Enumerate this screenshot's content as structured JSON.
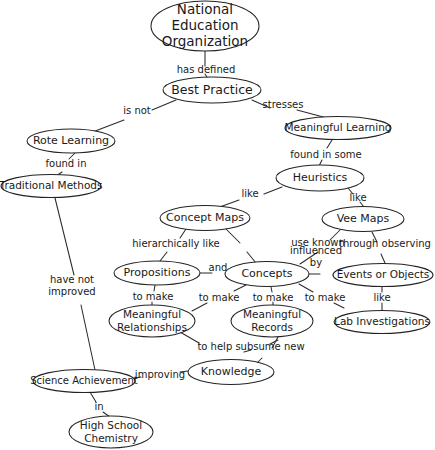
{
  "diagram": {
    "background_color": "#ffffff",
    "line_color": "#2b2b2b",
    "text_color": "#1a1a1a",
    "width": 435,
    "height": 450
  },
  "nodes": [
    {
      "id": "national-education-organization",
      "lines": [
        "National",
        "Education",
        "Organization"
      ],
      "cx": 205,
      "cy": 26,
      "rx": 54,
      "ry": 25,
      "font_size": 13.5
    },
    {
      "id": "best-practice",
      "lines": [
        "Best Practice"
      ],
      "cx": 212,
      "cy": 90,
      "rx": 49,
      "ry": 13,
      "font_size": 12.5
    },
    {
      "id": "rote-learning",
      "lines": [
        "Rote Learning"
      ],
      "cx": 71,
      "cy": 141,
      "rx": 44,
      "ry": 12,
      "font_size": 11
    },
    {
      "id": "meaningful-learning",
      "lines": [
        "Meaningful Learning"
      ],
      "cx": 338,
      "cy": 128,
      "rx": 53,
      "ry": 11.5,
      "font_size": 10.5
    },
    {
      "id": "traditional-methods",
      "lines": [
        "Traditional Methods"
      ],
      "cx": 51,
      "cy": 186,
      "rx": 50,
      "ry": 11.5,
      "font_size": 10.5
    },
    {
      "id": "heuristics",
      "lines": [
        "Heuristics"
      ],
      "cx": 320,
      "cy": 178,
      "rx": 44,
      "ry": 13,
      "font_size": 11
    },
    {
      "id": "concept-maps",
      "lines": [
        "Concept Maps"
      ],
      "cx": 205,
      "cy": 218,
      "rx": 45,
      "ry": 12.5,
      "font_size": 11
    },
    {
      "id": "vee-maps",
      "lines": [
        "Vee Maps"
      ],
      "cx": 363,
      "cy": 219,
      "rx": 41,
      "ry": 12.5,
      "font_size": 11
    },
    {
      "id": "propositions",
      "lines": [
        "Propositions"
      ],
      "cx": 157,
      "cy": 273,
      "rx": 43,
      "ry": 12,
      "font_size": 11
    },
    {
      "id": "concepts",
      "lines": [
        "Concepts"
      ],
      "cx": 267,
      "cy": 274,
      "rx": 42,
      "ry": 12.5,
      "font_size": 11
    },
    {
      "id": "events-or-objects",
      "lines": [
        "Events or Objects"
      ],
      "cx": 383,
      "cy": 275,
      "rx": 50,
      "ry": 11.5,
      "font_size": 10.5
    },
    {
      "id": "meaningful-relationships",
      "lines": [
        "Meaningful",
        "Relationships"
      ],
      "cx": 152,
      "cy": 321,
      "rx": 43,
      "ry": 16,
      "font_size": 10.5
    },
    {
      "id": "meaningful-records",
      "lines": [
        "Meaningful",
        "Records"
      ],
      "cx": 272,
      "cy": 321,
      "rx": 41,
      "ry": 16,
      "font_size": 10.5
    },
    {
      "id": "lab-investigations",
      "lines": [
        "Lab Investigations"
      ],
      "cx": 382,
      "cy": 322,
      "rx": 48,
      "ry": 11.5,
      "font_size": 10.5
    },
    {
      "id": "knowledge",
      "lines": [
        "Knowledge"
      ],
      "cx": 231,
      "cy": 372,
      "rx": 43,
      "ry": 12.5,
      "font_size": 11
    },
    {
      "id": "science-achievement",
      "lines": [
        "Science Achievement"
      ],
      "cx": 84,
      "cy": 381,
      "rx": 51,
      "ry": 11.5,
      "font_size": 10
    },
    {
      "id": "high-school-chemistry",
      "lines": [
        "High School",
        "Chemistry"
      ],
      "cx": 111,
      "cy": 432,
      "rx": 42,
      "ry": 16,
      "font_size": 10.5
    }
  ],
  "edges": [
    {
      "id": "neo-to-best-practice",
      "from": "national-education-organization",
      "to": "best-practice",
      "path": "M 205,51 L 205,66 M 205,74 L 207,77",
      "label": "has defined",
      "lx": 206,
      "ly": 70,
      "font_size": 10
    },
    {
      "id": "best-practice-to-rote-learning",
      "from": "best-practice",
      "to": "rote-learning",
      "path": "M 176,100 L 152,110 M 124,120 L 90,133",
      "label": "is not",
      "lx": 137,
      "ly": 111,
      "font_size": 10
    },
    {
      "id": "best-practice-to-meaningful-learning",
      "from": "best-practice",
      "to": "meaningful-learning",
      "path": "M 252,100 L 270,108 M 297,110 L 327,118",
      "label": "stresses",
      "lx": 283,
      "ly": 105,
      "font_size": 10
    },
    {
      "id": "rote-learning-to-traditional-methods",
      "from": "rote-learning",
      "to": "traditional-methods",
      "path": "M 75,153 L 69,159 M 62,172 L 56,176",
      "label": "found in",
      "lx": 66,
      "ly": 164,
      "font_size": 10
    },
    {
      "id": "meaningful-learning-to-heuristics",
      "from": "meaningful-learning",
      "to": "heuristics",
      "path": "M 332,140 L 327,148 M 322,160 L 319,166",
      "label": "found in some",
      "lx": 326,
      "ly": 155,
      "font_size": 10
    },
    {
      "id": "heuristics-to-concept-maps",
      "from": "heuristics",
      "to": "concept-maps",
      "path": "M 282,187 L 264,194 M 239,200 L 217,208",
      "label": "like",
      "lx": 250,
      "ly": 194,
      "font_size": 10
    },
    {
      "id": "heuristics-to-vee-maps",
      "from": "heuristics",
      "to": "vee-maps",
      "path": "M 348,188 L 353,194 M 360,202 L 364,207",
      "label": "like",
      "lx": 358,
      "ly": 198,
      "font_size": 10
    },
    {
      "id": "concept-maps-to-propositions",
      "from": "concept-maps",
      "to": "propositions",
      "path": "M 186,229 L 180,238 M 167,252 L 160,261",
      "label": "hierarchically like",
      "lx": 176,
      "ly": 244,
      "font_size": 10
    },
    {
      "id": "concept-maps-to-concepts",
      "from": "concept-maps",
      "to": "concepts",
      "path": "M 226,229 L 240,243 M 247,252 L 256,263",
      "label": "",
      "lx": 0,
      "ly": 0,
      "font_size": 10
    },
    {
      "id": "propositions-to-concepts",
      "from": "propositions",
      "to": "concepts",
      "path": "M 200,273 L 212,273 M 236,273 L 225,273",
      "label": "and",
      "lx": 218,
      "ly": 268,
      "font_size": 10
    },
    {
      "id": "vee-maps-to-concepts",
      "from": "vee-maps",
      "to": "concepts",
      "path": "M 340,230 L 330,240 M 318,252 L 300,264",
      "label": "use known",
      "lx": 318,
      "ly": 243,
      "font_size": 10
    },
    {
      "id": "vee-maps-to-events-or-objects",
      "from": "vee-maps",
      "to": "events-or-objects",
      "path": "M 372,232 L 377,242 M 381,254 L 385,263",
      "label": "through observing",
      "lx": 385,
      "ly": 244,
      "font_size": 10
    },
    {
      "id": "concepts-to-events-or-objects",
      "from": "concepts",
      "to": "events-or-objects",
      "path": "M 309,274 L 320,274 M 338,275 L 333,275",
      "label_lines": [
        "influenced",
        "by"
      ],
      "lx": 316,
      "ly": 257,
      "font_size": 10
    },
    {
      "id": "propositions-to-meaningful-relationships",
      "from": "propositions",
      "to": "meaningful-relationships",
      "path": "M 155,285 L 154,291 M 152,302 L 152,305",
      "label": "to make",
      "lx": 153,
      "ly": 297,
      "font_size": 10
    },
    {
      "id": "concepts-to-meaningful-relationships",
      "from": "concepts",
      "to": "meaningful-relationships",
      "path": "M 246,285 L 234,291 M 207,303 L 192,311",
      "label": "to make",
      "lx": 219,
      "ly": 298,
      "font_size": 10
    },
    {
      "id": "concepts-to-meaningful-records",
      "from": "concepts",
      "to": "meaningful-records",
      "path": "M 271,287 L 272,292 M 273,302 L 273,305",
      "label": "to make",
      "lx": 273,
      "ly": 298,
      "font_size": 10
    },
    {
      "id": "concepts-to-lab-investigations-via-make",
      "from": "concepts",
      "to": "meaningful-records",
      "path": "M 299,284 L 313,292 M 334,303 L 344,308",
      "label": "to make",
      "lx": 325,
      "ly": 298,
      "font_size": 10
    },
    {
      "id": "events-or-objects-to-lab-investigations",
      "from": "events-or-objects",
      "to": "lab-investigations",
      "path": "M 382,287 L 382,292 M 382,303 L 382,310",
      "label": "like",
      "lx": 382,
      "ly": 298,
      "font_size": 10
    },
    {
      "id": "meaningful-relationships-to-knowledge",
      "from": "meaningful-relationships",
      "to": "knowledge",
      "path": "M 180,332 L 199,343 M 251,350 L 244,352 M 270,344 L 278,340",
      "label": "to help subsume new",
      "lx": 251,
      "ly": 347,
      "font_size": 10
    },
    {
      "id": "meaningful-records-to-knowledge",
      "from": "meaningful-records",
      "to": "knowledge",
      "path": "M 278,337 L 272,348 M 262,358 L 257,363",
      "label": "",
      "lx": 0,
      "ly": 0,
      "font_size": 10
    },
    {
      "id": "traditional-methods-to-science-achievement",
      "from": "traditional-methods",
      "to": "science-achievement",
      "path": "M 55,198 L 74,275 M 81,305 L 95,370",
      "label_lines": [
        "have not",
        "improved"
      ],
      "lx": 72,
      "ly": 286,
      "font_size": 10
    },
    {
      "id": "science-achievement-to-knowledge",
      "from": "science-achievement",
      "to": "knowledge",
      "path": "M 134,378 L 141,377 M 180,372 L 188,371",
      "label": "improving",
      "lx": 160,
      "ly": 375,
      "font_size": 10
    },
    {
      "id": "science-achievement-to-high-school-chemistry",
      "from": "science-achievement",
      "to": "high-school-chemistry",
      "path": "M 90,392 L 96,402 M 103,412 L 110,417",
      "label": "in",
      "lx": 99,
      "ly": 407,
      "font_size": 10
    }
  ]
}
